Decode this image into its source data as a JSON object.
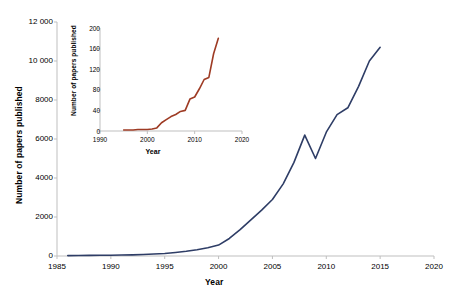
{
  "chart_data": [
    {
      "id": "main",
      "type": "line",
      "title": "",
      "xlabel": "Year",
      "ylabel": "Number of papers published",
      "xlim": [
        1985,
        2020
      ],
      "ylim": [
        0,
        12000
      ],
      "xticks": [
        "1985",
        "1990",
        "1995",
        "2000",
        "2005",
        "2010",
        "2015",
        "2020"
      ],
      "xtick_values": [
        1985,
        1990,
        1995,
        2000,
        2005,
        2010,
        2015,
        2020
      ],
      "yticks": [
        "0",
        "2000",
        "4000",
        "6000",
        "8000",
        "10 000",
        "12 000"
      ],
      "ytick_values": [
        0,
        2000,
        4000,
        6000,
        8000,
        10000,
        12000
      ],
      "grid": false,
      "legend": false,
      "line_color": "#2e3d66",
      "series": [
        {
          "name": "Number of papers published",
          "x": [
            1986,
            1987,
            1988,
            1989,
            1990,
            1991,
            1992,
            1993,
            1994,
            1995,
            1996,
            1997,
            1998,
            1999,
            2000,
            2001,
            2002,
            2003,
            2004,
            2005,
            2006,
            2007,
            2008,
            2009,
            2010,
            2011,
            2012,
            2013,
            2014,
            2015
          ],
          "values": [
            20,
            25,
            30,
            35,
            40,
            50,
            60,
            75,
            100,
            130,
            180,
            240,
            320,
            420,
            560,
            900,
            1350,
            1850,
            2350,
            2900,
            3700,
            4800,
            6200,
            5000,
            6350,
            7250,
            7600,
            8700,
            10000,
            10700
          ]
        }
      ]
    },
    {
      "id": "inset",
      "type": "line",
      "title": "",
      "xlabel": "Year",
      "ylabel": "Number of papers published",
      "xlim": [
        1990,
        2020
      ],
      "ylim": [
        0,
        200
      ],
      "xticks": [
        "1990",
        "2000",
        "2010",
        "2020"
      ],
      "xtick_values": [
        1990,
        2000,
        2010,
        2020
      ],
      "yticks": [
        "0",
        "40",
        "80",
        "120",
        "160",
        "200"
      ],
      "ytick_values": [
        0,
        40,
        80,
        120,
        160,
        200
      ],
      "grid": false,
      "legend": false,
      "line_color": "#9e3b24",
      "series": [
        {
          "name": "Number of papers published",
          "x": [
            1995,
            1996,
            1997,
            1998,
            1999,
            2000,
            2001,
            2002,
            2003,
            2004,
            2005,
            2006,
            2007,
            2008,
            2009,
            2010,
            2011,
            2012,
            2013,
            2014,
            2015
          ],
          "values": [
            2,
            2,
            2,
            3,
            3,
            3,
            4,
            6,
            16,
            22,
            28,
            32,
            38,
            40,
            62,
            66,
            82,
            100,
            104,
            150,
            180,
            165
          ]
        }
      ]
    }
  ]
}
